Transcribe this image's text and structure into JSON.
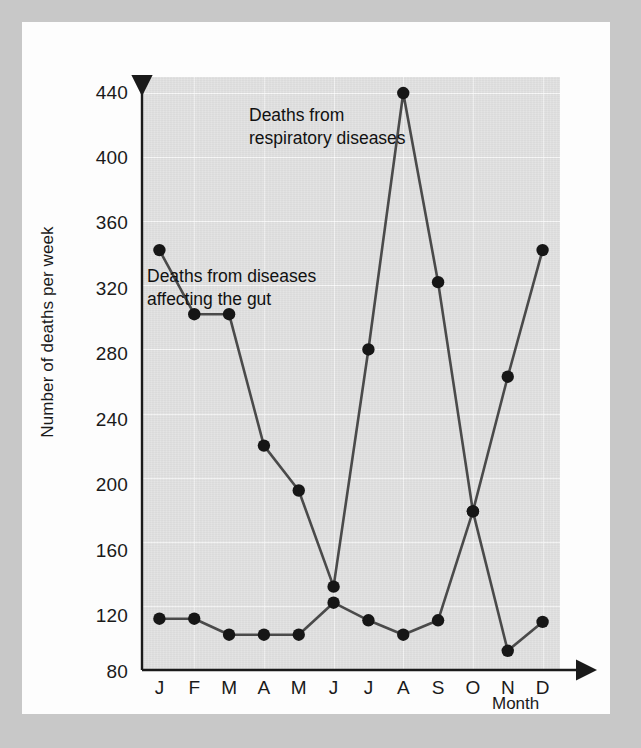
{
  "chart_data": {
    "type": "line",
    "title": "",
    "xlabel": "Month",
    "ylabel": "Number of deaths per week",
    "categories": [
      "J",
      "F",
      "M",
      "A",
      "M",
      "J",
      "J",
      "A",
      "S",
      "O",
      "N",
      "D"
    ],
    "xtick_labels": [
      "J",
      "F",
      "M",
      "A",
      "M",
      "J",
      "J",
      "A",
      "S",
      "O",
      "N",
      "D"
    ],
    "ytick_labels": [
      "440",
      "400",
      "360",
      "320",
      "280",
      "240",
      "200",
      "160",
      "120",
      "80"
    ],
    "ytick_values": [
      440,
      400,
      360,
      320,
      280,
      240,
      200,
      160,
      120,
      80
    ],
    "ylim": [
      80,
      450
    ],
    "ylim_label_min": 80,
    "ylim_label_max": 440,
    "ytick_step": 40,
    "grid": true,
    "legend": "annotations",
    "series": [
      {
        "name": "Deaths from respiratory diseases",
        "color": "#4a4a4a",
        "marker": "filled-circle",
        "values": [
          342,
          302,
          302,
          220,
          192,
          132,
          280,
          440,
          322,
          179,
          263,
          342
        ]
      },
      {
        "name": "Deaths from diseases affecting the gut",
        "color": "#4a4a4a",
        "marker": "filled-circle",
        "values": [
          112,
          112,
          102,
          102,
          102,
          122,
          111,
          102,
          111,
          179,
          92,
          110
        ]
      }
    ],
    "annotations": [
      {
        "id": "respiratory",
        "text": "Deaths from\nrespiratory diseases"
      },
      {
        "id": "gut",
        "text": "Deaths from diseases\naffecting the gut"
      }
    ]
  },
  "style": {
    "page_background": "#c8c8c8",
    "figure_background": "#fdfdfd",
    "plot_background": "#e2e2e2",
    "axis_color": "#1a1a1a",
    "line_color": "#4a4a4a",
    "grid_color": "#ffffff"
  }
}
